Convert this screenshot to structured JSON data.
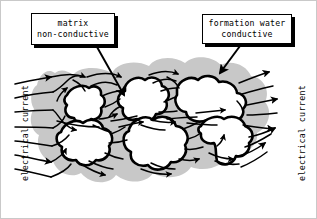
{
  "figure": {
    "background_color": "#ffffff",
    "border_color": "#c9c9c9"
  },
  "callouts": {
    "matrix": {
      "line1": "matrix",
      "line2": "non-conductive"
    },
    "water": {
      "line1": "formation water",
      "line2": "conductive"
    }
  },
  "axis_labels": {
    "left": "electrical current",
    "right": "electrical current"
  },
  "colors": {
    "pore_fill": "#c8c8c8",
    "grain_fill": "#ffffff",
    "grain_outline": "#000000",
    "flow_line": "#000000",
    "callout_border": "#000000",
    "callout_shadow": "#000000",
    "text": "#000000"
  },
  "legend_semantics": {
    "white_blobs": "matrix grains, non-conductive",
    "gray_region": "formation water filled pore space, conductive",
    "arrows": "electrical current direction, left to right"
  }
}
